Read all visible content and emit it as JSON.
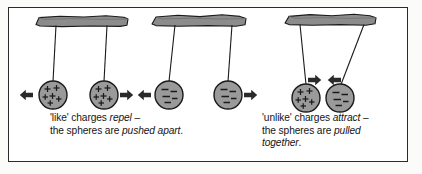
{
  "figure": {
    "border_color": "#2b2b2b",
    "background_color": "#ffffff"
  },
  "colors": {
    "support_fill": "#8c8c8c",
    "support_stroke": "#1a1a1a",
    "sphere_fill": "#9a9a9a",
    "sphere_stroke": "#1a1a1a",
    "thread_stroke": "#1a1a1a",
    "arrow_fill": "#2a2a2a",
    "charge_mark": "#1a1a1a",
    "text_color": "#151515"
  },
  "panels": [
    {
      "id": "repel-like-positive",
      "name": "like-positive-charges-panel",
      "support": {
        "name": "ceiling-support-left",
        "x": 36,
        "y": 16,
        "width": 92,
        "height": 10
      },
      "spheres": [
        {
          "name": "sphere-positive-left",
          "charge": "positive",
          "symbol": "+",
          "cx": 53,
          "cy": 95,
          "r": 14,
          "marks": 5
        },
        {
          "name": "sphere-positive-right",
          "charge": "positive",
          "symbol": "+",
          "cx": 104,
          "cy": 95,
          "r": 14,
          "marks": 5
        }
      ],
      "threads": [
        {
          "name": "thread-left",
          "x1": 53,
          "y1": 26,
          "x2": 53,
          "y2": 81
        },
        {
          "name": "thread-right",
          "x1": 104,
          "y1": 26,
          "x2": 104,
          "y2": 81
        }
      ],
      "arrows": [
        {
          "name": "force-arrow-left",
          "direction": "left",
          "x": 22,
          "y": 95
        },
        {
          "name": "force-arrow-right",
          "direction": "right",
          "x": 126,
          "y": 95
        }
      ]
    },
    {
      "id": "repel-like-negative",
      "name": "like-negative-charges-panel",
      "support": {
        "name": "ceiling-support-middle",
        "x": 154,
        "y": 16,
        "width": 92,
        "height": 10
      },
      "spheres": [
        {
          "name": "sphere-negative-left",
          "charge": "negative",
          "symbol": "−",
          "cx": 169,
          "cy": 95,
          "r": 14,
          "marks": 3
        },
        {
          "name": "sphere-negative-right",
          "charge": "negative",
          "symbol": "−",
          "cx": 228,
          "cy": 95,
          "r": 14,
          "marks": 3
        }
      ],
      "threads": [
        {
          "name": "thread-left",
          "x1": 169,
          "y1": 26,
          "x2": 169,
          "y2": 81
        },
        {
          "name": "thread-right",
          "x1": 228,
          "y1": 26,
          "x2": 228,
          "y2": 81
        }
      ],
      "arrows": [
        {
          "name": "force-arrow-left",
          "direction": "left",
          "x": 147,
          "y": 95
        },
        {
          "name": "force-arrow-right",
          "direction": "right",
          "x": 250,
          "y": 95
        }
      ]
    },
    {
      "id": "attract-unlike",
      "name": "unlike-charges-panel",
      "support": {
        "name": "ceiling-support-right",
        "x": 287,
        "y": 16,
        "width": 90,
        "height": 10
      },
      "spheres": [
        {
          "name": "sphere-positive",
          "charge": "positive",
          "symbol": "+",
          "cx": 307,
          "cy": 98,
          "r": 14,
          "marks": 5
        },
        {
          "name": "sphere-negative",
          "charge": "negative",
          "symbol": "−",
          "cx": 339,
          "cy": 98,
          "r": 14,
          "marks": 3
        }
      ],
      "threads": [
        {
          "name": "thread-left",
          "x1": 300,
          "y1": 26,
          "x2": 307,
          "y2": 84
        },
        {
          "name": "thread-right",
          "x1": 364,
          "y1": 26,
          "x2": 339,
          "y2": 84
        }
      ],
      "arrows": [
        {
          "name": "force-arrow-inward-right",
          "direction": "right",
          "x": 312,
          "y": 81
        },
        {
          "name": "force-arrow-inward-left",
          "direction": "left",
          "x": 334,
          "y": 81
        }
      ]
    }
  ],
  "captions": {
    "left": {
      "name": "caption-like-charges",
      "line1_a": "'like' charges ",
      "line1_em": "repel",
      "line1_b": " –",
      "line2_a": "the spheres are ",
      "line2_em": "pushed apart",
      "line2_b": "."
    },
    "right": {
      "name": "caption-unlike-charges",
      "line1_a": "'unlike' charges ",
      "line1_em": "attract",
      "line1_b": " –",
      "line2_a": "the spheres are ",
      "line2_em": "pulled",
      "line2_b": "",
      "line3_em": "together",
      "line3_b": "."
    }
  }
}
